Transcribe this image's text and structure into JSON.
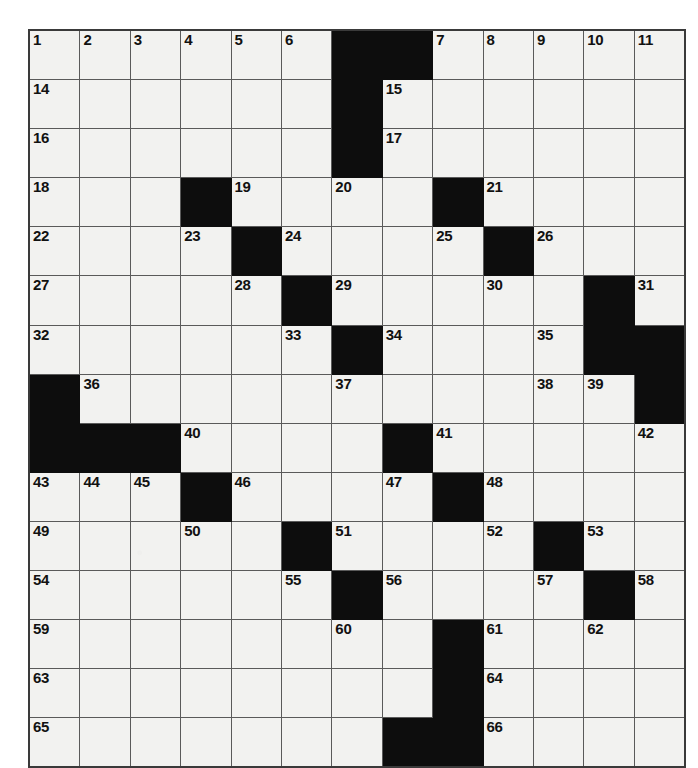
{
  "puzzle": {
    "type": "crossword-grid",
    "rows": 13,
    "columns": 13,
    "cell_size_px": 49,
    "colors": {
      "cell_fill": "#f2f2f0",
      "block_fill": "#0d0d0d",
      "grid_line": "#5a5a5a",
      "outer_border": "#3a3a3a",
      "number_text": "#111111",
      "page_background": "#ffffff"
    },
    "max_clue_number": 66,
    "grid": [
      [
        {
          "block": false,
          "num": "1"
        },
        {
          "block": false,
          "num": "2"
        },
        {
          "block": false,
          "num": "3"
        },
        {
          "block": false,
          "num": "4"
        },
        {
          "block": false,
          "num": "5"
        },
        {
          "block": false,
          "num": "6"
        },
        {
          "block": true,
          "num": ""
        },
        {
          "block": true,
          "num": ""
        },
        {
          "block": false,
          "num": "7"
        },
        {
          "block": false,
          "num": "8"
        },
        {
          "block": false,
          "num": "9"
        },
        {
          "block": false,
          "num": "10"
        },
        {
          "block": false,
          "num": "11"
        }
      ],
      [
        {
          "block": false,
          "num": "14"
        },
        {
          "block": false,
          "num": ""
        },
        {
          "block": false,
          "num": ""
        },
        {
          "block": false,
          "num": ""
        },
        {
          "block": false,
          "num": ""
        },
        {
          "block": false,
          "num": ""
        },
        {
          "block": true,
          "num": ""
        },
        {
          "block": false,
          "num": "15"
        },
        {
          "block": false,
          "num": ""
        },
        {
          "block": false,
          "num": ""
        },
        {
          "block": false,
          "num": ""
        },
        {
          "block": false,
          "num": ""
        },
        {
          "block": false,
          "num": ""
        }
      ],
      [
        {
          "block": false,
          "num": "16"
        },
        {
          "block": false,
          "num": ""
        },
        {
          "block": false,
          "num": ""
        },
        {
          "block": false,
          "num": ""
        },
        {
          "block": false,
          "num": ""
        },
        {
          "block": false,
          "num": ""
        },
        {
          "block": true,
          "num": ""
        },
        {
          "block": false,
          "num": "17"
        },
        {
          "block": false,
          "num": ""
        },
        {
          "block": false,
          "num": ""
        },
        {
          "block": false,
          "num": ""
        },
        {
          "block": false,
          "num": ""
        },
        {
          "block": false,
          "num": ""
        }
      ],
      [
        {
          "block": false,
          "num": "18"
        },
        {
          "block": false,
          "num": ""
        },
        {
          "block": false,
          "num": ""
        },
        {
          "block": true,
          "num": ""
        },
        {
          "block": false,
          "num": "19"
        },
        {
          "block": false,
          "num": ""
        },
        {
          "block": false,
          "num": "20"
        },
        {
          "block": false,
          "num": ""
        },
        {
          "block": true,
          "num": ""
        },
        {
          "block": false,
          "num": "21"
        },
        {
          "block": false,
          "num": ""
        },
        {
          "block": false,
          "num": ""
        },
        {
          "block": false,
          "num": ""
        }
      ],
      [
        {
          "block": false,
          "num": "22"
        },
        {
          "block": false,
          "num": ""
        },
        {
          "block": false,
          "num": ""
        },
        {
          "block": false,
          "num": "23"
        },
        {
          "block": true,
          "num": ""
        },
        {
          "block": false,
          "num": "24"
        },
        {
          "block": false,
          "num": ""
        },
        {
          "block": false,
          "num": ""
        },
        {
          "block": false,
          "num": "25"
        },
        {
          "block": true,
          "num": ""
        },
        {
          "block": false,
          "num": "26"
        },
        {
          "block": false,
          "num": ""
        },
        {
          "block": false,
          "num": ""
        }
      ],
      [
        {
          "block": false,
          "num": "27"
        },
        {
          "block": false,
          "num": ""
        },
        {
          "block": false,
          "num": ""
        },
        {
          "block": false,
          "num": ""
        },
        {
          "block": false,
          "num": "28"
        },
        {
          "block": true,
          "num": ""
        },
        {
          "block": false,
          "num": "29"
        },
        {
          "block": false,
          "num": ""
        },
        {
          "block": false,
          "num": ""
        },
        {
          "block": false,
          "num": "30"
        },
        {
          "block": false,
          "num": ""
        },
        {
          "block": true,
          "num": ""
        },
        {
          "block": false,
          "num": "31"
        }
      ],
      [
        {
          "block": false,
          "num": "32"
        },
        {
          "block": false,
          "num": ""
        },
        {
          "block": false,
          "num": ""
        },
        {
          "block": false,
          "num": ""
        },
        {
          "block": false,
          "num": ""
        },
        {
          "block": false,
          "num": "33"
        },
        {
          "block": true,
          "num": ""
        },
        {
          "block": false,
          "num": "34"
        },
        {
          "block": false,
          "num": ""
        },
        {
          "block": false,
          "num": ""
        },
        {
          "block": false,
          "num": "35"
        },
        {
          "block": true,
          "num": ""
        },
        {
          "block": true,
          "num": ""
        }
      ],
      [
        {
          "block": true,
          "num": ""
        },
        {
          "block": false,
          "num": "36"
        },
        {
          "block": false,
          "num": ""
        },
        {
          "block": false,
          "num": ""
        },
        {
          "block": false,
          "num": ""
        },
        {
          "block": false,
          "num": ""
        },
        {
          "block": false,
          "num": "37"
        },
        {
          "block": false,
          "num": ""
        },
        {
          "block": false,
          "num": ""
        },
        {
          "block": false,
          "num": ""
        },
        {
          "block": false,
          "num": "38"
        },
        {
          "block": false,
          "num": "39"
        },
        {
          "block": true,
          "num": ""
        }
      ],
      [
        {
          "block": true,
          "num": ""
        },
        {
          "block": true,
          "num": ""
        },
        {
          "block": true,
          "num": ""
        },
        {
          "block": false,
          "num": "40"
        },
        {
          "block": false,
          "num": ""
        },
        {
          "block": false,
          "num": ""
        },
        {
          "block": false,
          "num": ""
        },
        {
          "block": true,
          "num": ""
        },
        {
          "block": false,
          "num": "41"
        },
        {
          "block": false,
          "num": ""
        },
        {
          "block": false,
          "num": ""
        },
        {
          "block": false,
          "num": ""
        },
        {
          "block": false,
          "num": "42"
        }
      ],
      [
        {
          "block": false,
          "num": "43"
        },
        {
          "block": false,
          "num": "44"
        },
        {
          "block": false,
          "num": "45"
        },
        {
          "block": true,
          "num": ""
        },
        {
          "block": false,
          "num": "46"
        },
        {
          "block": false,
          "num": ""
        },
        {
          "block": false,
          "num": ""
        },
        {
          "block": false,
          "num": "47"
        },
        {
          "block": true,
          "num": ""
        },
        {
          "block": false,
          "num": "48"
        },
        {
          "block": false,
          "num": ""
        },
        {
          "block": false,
          "num": ""
        },
        {
          "block": false,
          "num": ""
        }
      ],
      [
        {
          "block": false,
          "num": "49"
        },
        {
          "block": false,
          "num": ""
        },
        {
          "block": false,
          "num": ""
        },
        {
          "block": false,
          "num": "50"
        },
        {
          "block": false,
          "num": ""
        },
        {
          "block": true,
          "num": ""
        },
        {
          "block": false,
          "num": "51"
        },
        {
          "block": false,
          "num": ""
        },
        {
          "block": false,
          "num": ""
        },
        {
          "block": false,
          "num": "52"
        },
        {
          "block": true,
          "num": ""
        },
        {
          "block": false,
          "num": "53"
        },
        {
          "block": false,
          "num": ""
        }
      ],
      [
        {
          "block": false,
          "num": "54"
        },
        {
          "block": false,
          "num": ""
        },
        {
          "block": false,
          "num": ""
        },
        {
          "block": false,
          "num": ""
        },
        {
          "block": false,
          "num": ""
        },
        {
          "block": false,
          "num": "55"
        },
        {
          "block": true,
          "num": ""
        },
        {
          "block": false,
          "num": "56"
        },
        {
          "block": false,
          "num": ""
        },
        {
          "block": false,
          "num": ""
        },
        {
          "block": false,
          "num": "57"
        },
        {
          "block": true,
          "num": ""
        },
        {
          "block": false,
          "num": "58"
        }
      ],
      [
        {
          "block": false,
          "num": "59"
        },
        {
          "block": false,
          "num": ""
        },
        {
          "block": false,
          "num": ""
        },
        {
          "block": false,
          "num": ""
        },
        {
          "block": false,
          "num": ""
        },
        {
          "block": false,
          "num": ""
        },
        {
          "block": false,
          "num": "60"
        },
        {
          "block": false,
          "num": ""
        },
        {
          "block": true,
          "num": ""
        },
        {
          "block": false,
          "num": "61"
        },
        {
          "block": false,
          "num": ""
        },
        {
          "block": false,
          "num": "62"
        },
        {
          "block": false,
          "num": ""
        }
      ]
    ],
    "extra_rows": [
      [
        {
          "block": false,
          "num": "63"
        },
        {
          "block": false,
          "num": ""
        },
        {
          "block": false,
          "num": ""
        },
        {
          "block": false,
          "num": ""
        },
        {
          "block": false,
          "num": ""
        },
        {
          "block": false,
          "num": ""
        },
        {
          "block": false,
          "num": ""
        },
        {
          "block": false,
          "num": ""
        },
        {
          "block": true,
          "num": ""
        },
        {
          "block": false,
          "num": "64"
        },
        {
          "block": false,
          "num": ""
        },
        {
          "block": false,
          "num": ""
        },
        {
          "block": false,
          "num": ""
        }
      ],
      [
        {
          "block": false,
          "num": "65"
        },
        {
          "block": false,
          "num": ""
        },
        {
          "block": false,
          "num": ""
        },
        {
          "block": false,
          "num": ""
        },
        {
          "block": false,
          "num": ""
        },
        {
          "block": false,
          "num": ""
        },
        {
          "block": false,
          "num": ""
        },
        {
          "block": true,
          "num": ""
        },
        {
          "block": true,
          "num": ""
        },
        {
          "block": false,
          "num": "66"
        },
        {
          "block": false,
          "num": ""
        },
        {
          "block": false,
          "num": ""
        },
        {
          "block": false,
          "num": ""
        }
      ]
    ]
  }
}
